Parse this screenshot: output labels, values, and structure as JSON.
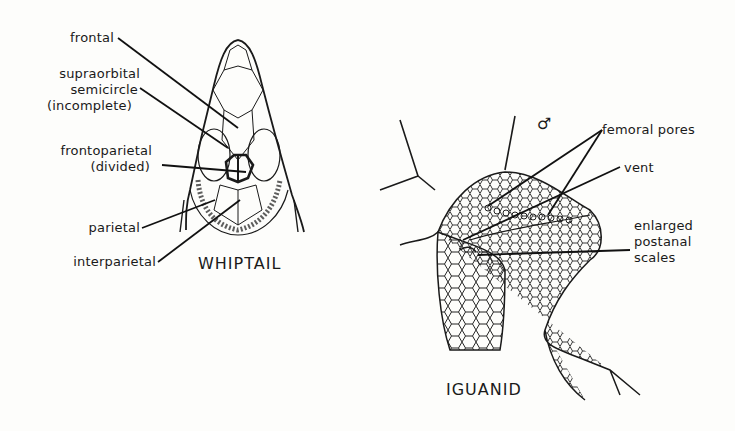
{
  "whiptail": {
    "title": "WHIPTAIL",
    "labels": {
      "frontal": "frontal",
      "supraorbital_1": "supraorbital",
      "supraorbital_2": "semicircle",
      "supraorbital_3": "(incomplete)",
      "frontoparietal_1": "frontoparietal",
      "frontoparietal_2": "(divided)",
      "parietal": "parietal",
      "interparietal": "interparietal"
    }
  },
  "iguanid": {
    "title": "IGUANID",
    "male_symbol": "♂",
    "labels": {
      "femoral_pores": "femoral pores",
      "vent": "vent",
      "postanal_1": "enlarged",
      "postanal_2": "postanal",
      "postanal_3": "scales"
    }
  }
}
